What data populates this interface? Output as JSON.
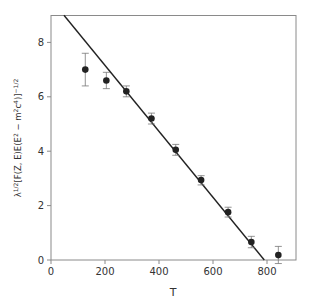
{
  "chart_data": {
    "type": "scatter",
    "title": "",
    "xlabel": "T",
    "ylabel": "λ^{1/2}[F(Z, E)E(E² − m²c⁴)]^{−1/2}",
    "ylabel_parts": {
      "base": "λ",
      "sup1": "1/2",
      "mid": "[F(Z, E)E(E",
      "sup2": "2",
      "mid2": " − m",
      "sup3": "2",
      "mid3": "c",
      "sup4": "4",
      "mid4": ")]",
      "sup5": "−1/2"
    },
    "xlim": [
      0,
      900
    ],
    "ylim": [
      0,
      9
    ],
    "xticks": [
      0,
      200,
      400,
      600,
      800
    ],
    "yticks": [
      0,
      2,
      4,
      6,
      8
    ],
    "grid": false,
    "legend": null,
    "series": [
      {
        "name": "data",
        "points": [
          {
            "x": 127,
            "y": 7.0,
            "err_low": 6.4,
            "err_high": 7.6
          },
          {
            "x": 205,
            "y": 6.6,
            "err_low": 6.3,
            "err_high": 6.9
          },
          {
            "x": 279,
            "y": 6.2,
            "err_low": 6.0,
            "err_high": 6.4
          },
          {
            "x": 372,
            "y": 5.2,
            "err_low": 5.0,
            "err_high": 5.4
          },
          {
            "x": 462,
            "y": 4.05,
            "err_low": 3.85,
            "err_high": 4.25
          },
          {
            "x": 556,
            "y": 2.94,
            "err_low": 2.76,
            "err_high": 3.1
          },
          {
            "x": 656,
            "y": 1.76,
            "err_low": 1.58,
            "err_high": 1.94
          },
          {
            "x": 742,
            "y": 0.66,
            "err_low": 0.45,
            "err_high": 0.87
          },
          {
            "x": 842,
            "y": 0.18,
            "err_low": -0.13,
            "err_high": 0.5
          }
        ]
      },
      {
        "name": "fit line",
        "type": "line",
        "x": [
          48,
          790
        ],
        "y": [
          9.0,
          0.0
        ]
      }
    ]
  },
  "colors": {
    "axis": "#8a8a8a",
    "marker": "#222222",
    "line": "#222222",
    "errorbar": "#777777",
    "text": "#333333"
  }
}
